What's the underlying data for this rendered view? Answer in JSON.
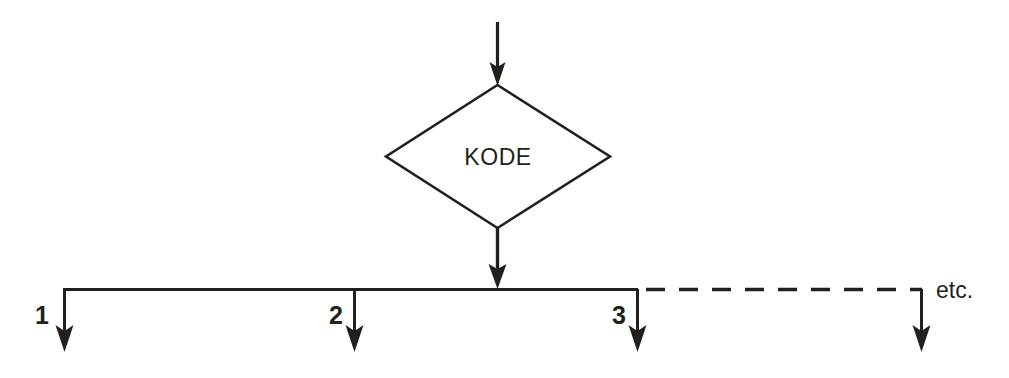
{
  "diagram": {
    "type": "flowchart",
    "background_color": "#ffffff",
    "line_color": "#231f1c",
    "decision": {
      "shape": "diamond",
      "label": "KODE"
    },
    "entry_arrow": {
      "name": "input-arrow",
      "direction": "down"
    },
    "exit_arrow": {
      "name": "decision-exit-arrow",
      "direction": "down"
    },
    "branches": [
      {
        "label": "1",
        "style": "solid"
      },
      {
        "label": "2",
        "style": "solid"
      },
      {
        "label": "3",
        "style": "solid"
      },
      {
        "label": "",
        "style": "dashed"
      }
    ],
    "continuation_label": "etc.",
    "connector_style": {
      "solid_segment": "solid",
      "continuation_segment": "dashed"
    }
  }
}
